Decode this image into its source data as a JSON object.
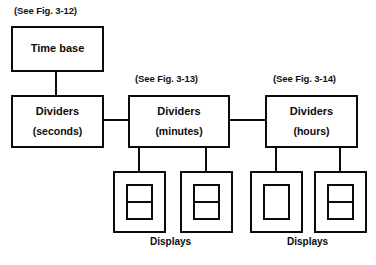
{
  "figure": {
    "type": "block-diagram",
    "captions": [
      {
        "id": "cap-time-base",
        "text": "(See Fig. 3-12)",
        "x": 14,
        "y": 5
      },
      {
        "id": "cap-minutes",
        "text": "(See Fig. 3-13)",
        "x": 135,
        "y": 73
      },
      {
        "id": "cap-hours",
        "text": "(See Fig. 3-14)",
        "x": 273,
        "y": 73
      }
    ],
    "blocks": [
      {
        "id": "time-base",
        "line1": "Time base",
        "line2": "",
        "x": 11,
        "y": 26,
        "w": 93,
        "h": 46
      },
      {
        "id": "dividers-seconds",
        "line1": "Dividers",
        "line2": "(seconds)",
        "x": 11,
        "y": 95,
        "w": 93,
        "h": 53
      },
      {
        "id": "dividers-minutes",
        "line1": "Dividers",
        "line2": "(minutes)",
        "x": 128,
        "y": 95,
        "w": 102,
        "h": 53
      },
      {
        "id": "dividers-hours",
        "line1": "Dividers",
        "line2": "(hours)",
        "x": 265,
        "y": 95,
        "w": 93,
        "h": 53
      }
    ],
    "displays": [
      {
        "id": "display-minutes-tens",
        "x": 113,
        "y": 171,
        "w": 53,
        "h": 62,
        "segmented": true,
        "stem_x": 139
      },
      {
        "id": "display-minutes-ones",
        "x": 180,
        "y": 171,
        "w": 53,
        "h": 62,
        "segmented": true,
        "stem_x": 206
      },
      {
        "id": "display-hours-tens",
        "x": 250,
        "y": 171,
        "w": 53,
        "h": 62,
        "segmented": false,
        "stem_x": 276
      },
      {
        "id": "display-hours-ones",
        "x": 314,
        "y": 171,
        "w": 53,
        "h": 62,
        "segmented": true,
        "stem_x": 340
      }
    ],
    "display_labels": [
      {
        "id": "label-displays-minutes",
        "text": "Displays",
        "x": 150,
        "y": 236
      },
      {
        "id": "label-displays-hours",
        "text": "Displays",
        "x": 287,
        "y": 236
      }
    ],
    "wires": [
      {
        "id": "wire-timebase-to-seconds",
        "orient": "v",
        "x": 56,
        "y": 72,
        "len": 24
      },
      {
        "id": "wire-seconds-to-minutes",
        "orient": "h",
        "x": 104,
        "y": 120,
        "len": 25
      },
      {
        "id": "wire-minutes-to-hours",
        "orient": "h",
        "x": 230,
        "y": 120,
        "len": 36
      },
      {
        "id": "wire-minutes-stem-left",
        "orient": "v",
        "x": 139,
        "y": 148,
        "len": 24
      },
      {
        "id": "wire-minutes-stem-right",
        "orient": "v",
        "x": 206,
        "y": 148,
        "len": 24
      },
      {
        "id": "wire-hours-stem-left",
        "orient": "v",
        "x": 276,
        "y": 148,
        "len": 24
      },
      {
        "id": "wire-hours-stem-right",
        "orient": "v",
        "x": 340,
        "y": 148,
        "len": 24
      }
    ],
    "colors": {
      "line": "#0b0b0b",
      "background": "#ffffff",
      "text": "#0b0b0b"
    }
  }
}
